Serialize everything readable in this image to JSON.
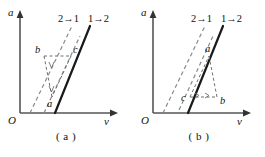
{
  "figure": {
    "type": "diagram",
    "axis": {
      "vertical_label": "a",
      "horizontal_label": "v",
      "origin_label": "O"
    },
    "panels": [
      {
        "caption": "( a )",
        "curves": [
          {
            "label": "2→1",
            "style": "dashed"
          },
          {
            "label": "1→2",
            "style": "solid"
          }
        ],
        "points": [
          {
            "label": "b",
            "position": "upper-left"
          },
          {
            "label": "c",
            "position": "upper-right"
          },
          {
            "label": "a",
            "position": "lower"
          }
        ]
      },
      {
        "caption": "( b )",
        "curves": [
          {
            "label": "2→1",
            "style": "dashed"
          },
          {
            "label": "1→2",
            "style": "solid"
          }
        ],
        "points": [
          {
            "label": "a",
            "position": "upper"
          },
          {
            "label": "c",
            "position": "lower-left"
          },
          {
            "label": "b",
            "position": "lower-right"
          }
        ]
      }
    ],
    "colors": {
      "ink": "#111111",
      "dashed": "#8a8a8a",
      "axis": "#555555",
      "background": "#ffffff"
    }
  }
}
